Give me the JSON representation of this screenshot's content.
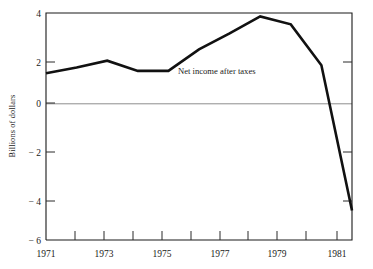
{
  "chart_data": {
    "type": "line",
    "title": "",
    "subtitle": "",
    "xlabel": "",
    "ylabel": "Billions of dollars",
    "xlim": [
      1970.5,
      1981.5
    ],
    "ylim": [
      -6,
      4
    ],
    "grid": false,
    "legend_position": "inline-annotation",
    "zero_reference_line": true,
    "x_tick_labels": [
      "1971",
      "1973",
      "1975",
      "1977",
      "1979",
      "1981"
    ],
    "x_tick_label_values": [
      1971,
      1973,
      1975,
      1977,
      1979,
      1981
    ],
    "x_minor_ticks": [
      1972,
      1974,
      1976,
      1978,
      1980
    ],
    "y_tick_labels": [
      "4",
      "2",
      "0",
      "− 2",
      "− 4",
      "− 6"
    ],
    "y_tick_values": [
      4,
      2,
      0,
      -2,
      -4,
      -6
    ],
    "series": [
      {
        "name": "Net income after taxes",
        "annotation": "Net income after taxes",
        "color": "#111111",
        "x": [
          1971,
          1972,
          1973,
          1974,
          1975,
          1976,
          1977,
          1978,
          1979,
          1980,
          1981
        ],
        "values": [
          1.35,
          1.6,
          1.9,
          1.45,
          1.45,
          2.4,
          3.1,
          3.85,
          3.5,
          1.7,
          -4.7
        ]
      }
    ]
  },
  "axes": {
    "y_axis_label": "Billions of dollars",
    "x_labels": [
      {
        "label": "1971"
      },
      {
        "label": "1973"
      },
      {
        "label": "1975"
      },
      {
        "label": "1977"
      },
      {
        "label": "1979"
      },
      {
        "label": "1981"
      }
    ],
    "y_labels": [
      {
        "label": "4"
      },
      {
        "label": "2"
      },
      {
        "label": "0"
      },
      {
        "label": "− 2"
      },
      {
        "label": "− 4"
      },
      {
        "label": "− 6"
      }
    ]
  },
  "annotations": {
    "series_label": "Net income after taxes"
  },
  "colors": {
    "line": "#111111",
    "frame": "#1b1b1b",
    "zero_line": "#8d8d8d",
    "text": "#1a1a1a",
    "background": "#ffffff"
  }
}
